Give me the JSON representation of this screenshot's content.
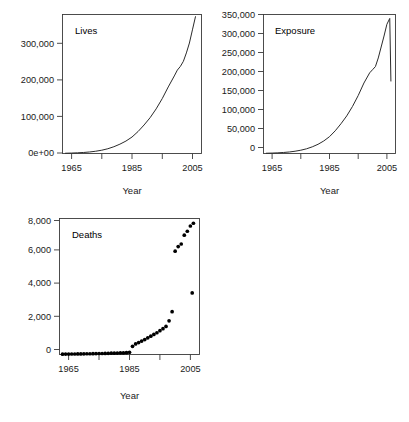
{
  "figure": {
    "title_fragment": "",
    "background": "#ffffff",
    "line_color": "#2b2b2b",
    "point_color": "#000000",
    "axis_color": "#3a3a3a",
    "text_color": "#1a1a1a"
  },
  "chart_data": [
    {
      "type": "line",
      "title": "Lives",
      "panel_label": "Lives",
      "xlabel": "Year",
      "ylabel": "",
      "xlim": [
        1962,
        2008
      ],
      "ylim": [
        0,
        380000
      ],
      "grid": false,
      "legend": "none",
      "xticks": [
        1965,
        1975,
        1985,
        1995,
        2005
      ],
      "xticklabels": [
        "1965",
        "",
        "1985",
        "",
        "2005"
      ],
      "yticks": [
        0,
        100000,
        200000,
        300000
      ],
      "yticklabels": [
        "0e+00",
        "100,000",
        "200,000",
        "300,000"
      ],
      "x": [
        1963,
        1965,
        1967,
        1969,
        1971,
        1973,
        1975,
        1977,
        1979,
        1981,
        1983,
        1985,
        1987,
        1989,
        1991,
        1993,
        1995,
        1997,
        1999,
        2000,
        2001,
        2002,
        2003,
        2004,
        2005,
        2006
      ],
      "values": [
        800,
        1200,
        1900,
        2800,
        4200,
        6200,
        9000,
        13000,
        18500,
        25500,
        34000,
        45000,
        60000,
        78000,
        98000,
        122000,
        150000,
        182000,
        212000,
        228000,
        238000,
        252000,
        275000,
        302000,
        338000,
        374000
      ]
    },
    {
      "type": "line",
      "title": "Exposure",
      "panel_label": "Exposure",
      "xlabel": "Year",
      "ylabel": "",
      "xlim": [
        1962,
        2008
      ],
      "ylim": [
        0,
        355000
      ],
      "grid": false,
      "legend": "none",
      "xticks": [
        1965,
        1975,
        1985,
        1995,
        2005
      ],
      "xticklabels": [
        "1965",
        "",
        "1985",
        "",
        "2005"
      ],
      "yticks": [
        0,
        50000,
        100000,
        150000,
        200000,
        250000,
        300000,
        350000
      ],
      "yticklabels": [
        "0",
        "50,000",
        "100,000",
        "150,000",
        "200,000",
        "250,000",
        "300,000",
        "350,000"
      ],
      "x": [
        1963,
        1965,
        1967,
        1969,
        1971,
        1973,
        1975,
        1977,
        1979,
        1981,
        1983,
        1985,
        1987,
        1989,
        1991,
        1993,
        1995,
        1997,
        1999,
        2000,
        2001,
        2002,
        2003,
        2004,
        2005,
        2006,
        2006.4
      ],
      "values": [
        700,
        1100,
        1700,
        2600,
        3900,
        5800,
        8400,
        12000,
        17000,
        23500,
        32000,
        43000,
        58000,
        76000,
        96000,
        120000,
        148000,
        180000,
        206000,
        214000,
        222000,
        244000,
        272000,
        300000,
        330000,
        345000,
        185000
      ]
    },
    {
      "type": "scatter",
      "title": "Deaths",
      "panel_label": "Deaths",
      "xlabel": "Year",
      "ylabel": "",
      "xlim": [
        1962,
        2008
      ],
      "ylim": [
        0,
        8000
      ],
      "grid": false,
      "legend": "none",
      "xticks": [
        1965,
        1975,
        1985,
        1995,
        2005
      ],
      "xticklabels": [
        "1965",
        "",
        "1985",
        "",
        "2005"
      ],
      "yticks": [
        0,
        2000,
        4000,
        6000,
        8000
      ],
      "yticklabels": [
        "0",
        "2,000",
        "4,000",
        "6,000",
        "8,000"
      ],
      "x": [
        1963,
        1964,
        1965,
        1966,
        1967,
        1968,
        1969,
        1970,
        1971,
        1972,
        1973,
        1974,
        1975,
        1976,
        1977,
        1978,
        1979,
        1980,
        1981,
        1982,
        1983,
        1984,
        1985,
        1986,
        1987,
        1988,
        1989,
        1990,
        1991,
        1992,
        1993,
        1994,
        1995,
        1996,
        1997,
        1998,
        1999,
        2000,
        2001,
        2002,
        2003,
        2004,
        2005,
        2006
      ],
      "values": [
        20,
        25,
        25,
        30,
        30,
        35,
        35,
        40,
        45,
        45,
        50,
        55,
        60,
        60,
        65,
        70,
        75,
        80,
        85,
        90,
        95,
        110,
        130,
        480,
        620,
        700,
        790,
        880,
        980,
        1080,
        1180,
        1280,
        1400,
        1520,
        1650,
        1980,
        2520,
        6080,
        6350,
        6500,
        7020,
        7250,
        7560,
        7720
      ],
      "outlier_note": "one low point near 2005 at about 3,620",
      "outliers": [
        {
          "x": 2005.6,
          "y": 3620
        }
      ]
    }
  ]
}
